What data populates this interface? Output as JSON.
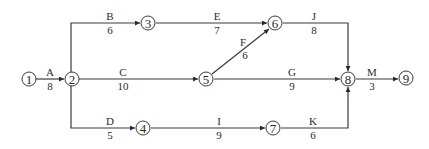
{
  "diagram": {
    "type": "activity-on-arrow network",
    "nodes": [
      {
        "id": "1",
        "label": "1",
        "x": 29,
        "y": 79
      },
      {
        "id": "2",
        "label": "2",
        "x": 72,
        "y": 79
      },
      {
        "id": "3",
        "label": "3",
        "x": 148,
        "y": 23
      },
      {
        "id": "4",
        "label": "4",
        "x": 143,
        "y": 128
      },
      {
        "id": "5",
        "label": "5",
        "x": 206,
        "y": 79
      },
      {
        "id": "6",
        "label": "6",
        "x": 275,
        "y": 23
      },
      {
        "id": "7",
        "label": "7",
        "x": 273,
        "y": 128
      },
      {
        "id": "8",
        "label": "8",
        "x": 348,
        "y": 79
      },
      {
        "id": "9",
        "label": "9",
        "x": 406,
        "y": 78
      }
    ],
    "activities": [
      {
        "name": "A",
        "duration": "8",
        "from": "1",
        "to": "2"
      },
      {
        "name": "B",
        "duration": "6",
        "from": "2",
        "to": "3"
      },
      {
        "name": "C",
        "duration": "10",
        "from": "2",
        "to": "5"
      },
      {
        "name": "D",
        "duration": "5",
        "from": "2",
        "to": "4"
      },
      {
        "name": "E",
        "duration": "7",
        "from": "3",
        "to": "6"
      },
      {
        "name": "F",
        "duration": "6",
        "from": "5",
        "to": "6"
      },
      {
        "name": "G",
        "duration": "9",
        "from": "5",
        "to": "8"
      },
      {
        "name": "I",
        "duration": "9",
        "from": "4",
        "to": "7"
      },
      {
        "name": "J",
        "duration": "8",
        "from": "6",
        "to": "8"
      },
      {
        "name": "K",
        "duration": "6",
        "from": "7",
        "to": "8"
      },
      {
        "name": "M",
        "duration": "3",
        "from": "8",
        "to": "9"
      }
    ]
  }
}
